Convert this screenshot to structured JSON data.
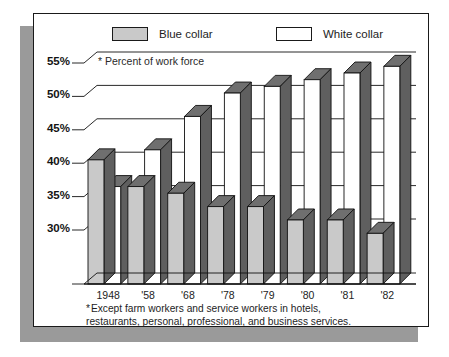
{
  "card": {
    "background": "#ffffff",
    "border_color": "#1a1a1a",
    "shadow_color": "#9a9a9a"
  },
  "legend": {
    "entries": [
      {
        "label": "Blue collar",
        "swatch": "light-gray",
        "color": "#c9c9c9",
        "icon": "legend-swatch-icon"
      },
      {
        "label": "White collar",
        "swatch": "white",
        "color": "#ffffff",
        "icon": "legend-swatch-icon"
      }
    ]
  },
  "axis_note": "* Percent of work force",
  "footnote": {
    "star": "*",
    "line1": "Except farm workers and service workers in hotels,",
    "line2": "restaurants, personal, professional, and business services."
  },
  "chart_data": {
    "type": "bar",
    "title": "",
    "subtitle": "",
    "xlabel": "",
    "ylabel": "* Percent of work force",
    "ylim": [
      25,
      57
    ],
    "ytick_values": [
      55,
      50,
      45,
      40,
      35,
      30
    ],
    "ytick_labels": [
      "55%",
      "50%",
      "45%",
      "40%",
      "35%",
      "30%"
    ],
    "grid": true,
    "legend_position": "top",
    "style": "3d-isometric",
    "categories": [
      "1948",
      "'58",
      "'68",
      "'78",
      "'79",
      "'80",
      "'81",
      "'82"
    ],
    "series": [
      {
        "name": "Blue collar",
        "color": "#c9c9c9",
        "side_color": "#6f6f6f",
        "values": [
          40.5,
          36.5,
          35.5,
          33.5,
          33.5,
          31.5,
          31.5,
          29.5
        ]
      },
      {
        "name": "White collar",
        "color": "#ffffff",
        "side_color": "#6f6f6f",
        "values": [
          36.5,
          42.0,
          47.0,
          50.5,
          51.5,
          52.5,
          53.5,
          54.5
        ]
      }
    ],
    "notes": [
      "Dark gray faces are the 3-D side/top faces of each bar.",
      "Blue collar share declines while white collar share rises."
    ]
  }
}
